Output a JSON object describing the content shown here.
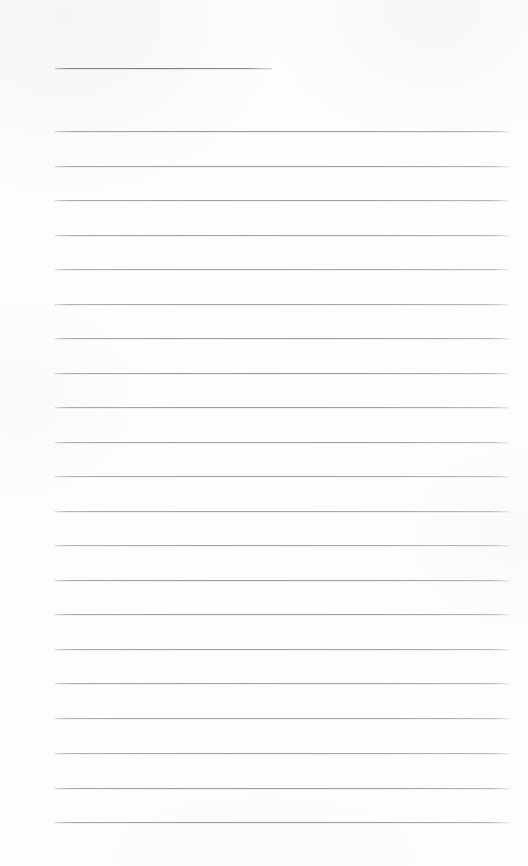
{
  "document": {
    "kind": "ruled-notepaper-scan",
    "page_label": "",
    "width_px": 528,
    "height_px": 866,
    "background_color": "#fdfdfd",
    "text_content": "",
    "is_blank": true
  },
  "palette": {
    "paper": "#fdfdfd",
    "rule_line": "#9aa0a7",
    "title_rule_line": "#767b82",
    "margin": "#ffffff"
  },
  "layout": {
    "rule_left_x": 55,
    "rule_right_x": 509,
    "rule_width": 454,
    "left_margin_width": 55,
    "right_margin_width": 19,
    "rule_thickness": 1
  },
  "title_rule": {
    "name": "title-rule",
    "y": 68,
    "x_start": 55,
    "x_end": 272,
    "width": 217,
    "color": "#767b82",
    "thickness": 1
  },
  "body_rules": {
    "count": 21,
    "first_y": 131,
    "last_y": 822,
    "spacing": 34.55,
    "color": "#9aa0a7",
    "thickness": 1,
    "lines": [
      {
        "index": 1,
        "y": 131,
        "content": ""
      },
      {
        "index": 2,
        "y": 166,
        "content": ""
      },
      {
        "index": 3,
        "y": 200,
        "content": ""
      },
      {
        "index": 4,
        "y": 235,
        "content": ""
      },
      {
        "index": 5,
        "y": 269,
        "content": ""
      },
      {
        "index": 6,
        "y": 304,
        "content": ""
      },
      {
        "index": 7,
        "y": 338,
        "content": ""
      },
      {
        "index": 8,
        "y": 373,
        "content": ""
      },
      {
        "index": 9,
        "y": 407,
        "content": ""
      },
      {
        "index": 10,
        "y": 442,
        "content": ""
      },
      {
        "index": 11,
        "y": 476,
        "content": ""
      },
      {
        "index": 12,
        "y": 511,
        "content": ""
      },
      {
        "index": 13,
        "y": 545,
        "content": ""
      },
      {
        "index": 14,
        "y": 580,
        "content": ""
      },
      {
        "index": 15,
        "y": 614,
        "content": ""
      },
      {
        "index": 16,
        "y": 649,
        "content": ""
      },
      {
        "index": 17,
        "y": 683,
        "content": ""
      },
      {
        "index": 18,
        "y": 718,
        "content": ""
      },
      {
        "index": 19,
        "y": 753,
        "content": ""
      },
      {
        "index": 20,
        "y": 788,
        "content": ""
      },
      {
        "index": 21,
        "y": 822,
        "content": ""
      }
    ]
  }
}
